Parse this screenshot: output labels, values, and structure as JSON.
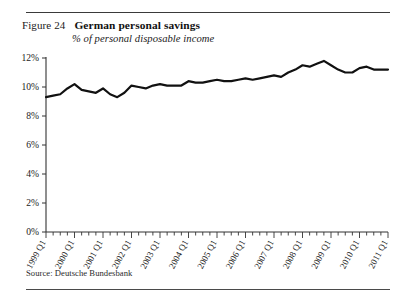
{
  "figure": {
    "number_label": "Figure 24",
    "title": "German personal savings",
    "subtitle": "% of personal disposable income",
    "source": "Source: Deutsche Bundesbank"
  },
  "chart_data": {
    "type": "line",
    "title": "German personal savings",
    "subtitle": "% of personal disposable income",
    "xlabel": "",
    "ylabel": "% of personal disposable income",
    "ylim": [
      0,
      12
    ],
    "ytick_labels": [
      "0%",
      "2%",
      "4%",
      "6%",
      "8%",
      "10%",
      "12%"
    ],
    "ytick_values": [
      0,
      2,
      4,
      6,
      8,
      10,
      12
    ],
    "grid": false,
    "legend": "none",
    "line_color": "#111111",
    "line_width": 2.2,
    "xtick_labels": [
      "1999 Q1",
      "2000 Q1",
      "2001 Q1",
      "2002 Q1",
      "2003 Q1",
      "2004 Q1",
      "2005 Q1",
      "2006 Q1",
      "2007 Q1",
      "2008 Q1",
      "2009 Q1",
      "2010 Q1",
      "2011 Q1"
    ],
    "x": [
      "1999 Q1",
      "1999 Q2",
      "1999 Q3",
      "1999 Q4",
      "2000 Q1",
      "2000 Q2",
      "2000 Q3",
      "2000 Q4",
      "2001 Q1",
      "2001 Q2",
      "2001 Q3",
      "2001 Q4",
      "2002 Q1",
      "2002 Q2",
      "2002 Q3",
      "2002 Q4",
      "2003 Q1",
      "2003 Q2",
      "2003 Q3",
      "2003 Q4",
      "2004 Q1",
      "2004 Q2",
      "2004 Q3",
      "2004 Q4",
      "2005 Q1",
      "2005 Q2",
      "2005 Q3",
      "2005 Q4",
      "2006 Q1",
      "2006 Q2",
      "2006 Q3",
      "2006 Q4",
      "2007 Q1",
      "2007 Q2",
      "2007 Q3",
      "2007 Q4",
      "2008 Q1",
      "2008 Q2",
      "2008 Q3",
      "2008 Q4",
      "2009 Q1",
      "2009 Q2",
      "2009 Q3",
      "2009 Q4",
      "2010 Q1",
      "2010 Q2",
      "2010 Q3",
      "2010 Q4",
      "2011 Q1"
    ],
    "values": [
      9.3,
      9.4,
      9.5,
      9.9,
      10.2,
      9.8,
      9.7,
      9.6,
      9.9,
      9.5,
      9.3,
      9.6,
      10.1,
      10.0,
      9.9,
      10.1,
      10.2,
      10.1,
      10.1,
      10.1,
      10.4,
      10.3,
      10.3,
      10.4,
      10.5,
      10.4,
      10.4,
      10.5,
      10.6,
      10.5,
      10.6,
      10.7,
      10.8,
      10.7,
      11.0,
      11.2,
      11.5,
      11.4,
      11.6,
      11.8,
      11.5,
      11.2,
      11.0,
      11.0,
      11.3,
      11.4,
      11.2,
      11.2,
      11.2
    ],
    "series": [
      {
        "name": "German personal savings",
        "values": [
          9.3,
          9.4,
          9.5,
          9.9,
          10.2,
          9.8,
          9.7,
          9.6,
          9.9,
          9.5,
          9.3,
          9.6,
          10.1,
          10.0,
          9.9,
          10.1,
          10.2,
          10.1,
          10.1,
          10.1,
          10.4,
          10.3,
          10.3,
          10.4,
          10.5,
          10.4,
          10.4,
          10.5,
          10.6,
          10.5,
          10.6,
          10.7,
          10.8,
          10.7,
          11.0,
          11.2,
          11.5,
          11.4,
          11.6,
          11.8,
          11.5,
          11.2,
          11.0,
          11.0,
          11.3,
          11.4,
          11.2,
          11.2,
          11.2
        ]
      }
    ]
  }
}
